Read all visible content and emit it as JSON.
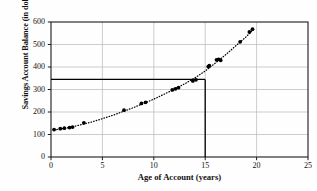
{
  "chart_data": {
    "type": "scatter",
    "title": "",
    "xlabel": "Age of Account (years)",
    "ylabel": "Savings Account Balance (in dollars)",
    "xlim": [
      0,
      25
    ],
    "ylim": [
      0,
      600
    ],
    "xticks": [
      0,
      5,
      10,
      15,
      20,
      25
    ],
    "yticks": [
      0,
      100,
      200,
      300,
      400,
      500,
      600
    ],
    "xtick_labels": [
      "0",
      "5",
      "10",
      "15",
      "20",
      "25"
    ],
    "ytick_labels": [
      "0",
      "100",
      "200",
      "300",
      "400",
      "500",
      "600"
    ],
    "grid": "both",
    "legend": "none",
    "points": [
      {
        "x": 0.3,
        "y": 122
      },
      {
        "x": 0.9,
        "y": 126
      },
      {
        "x": 1.3,
        "y": 128
      },
      {
        "x": 1.8,
        "y": 131
      },
      {
        "x": 2.1,
        "y": 133
      },
      {
        "x": 3.2,
        "y": 152
      },
      {
        "x": 7.1,
        "y": 208
      },
      {
        "x": 8.8,
        "y": 238
      },
      {
        "x": 9.2,
        "y": 243
      },
      {
        "x": 11.8,
        "y": 298
      },
      {
        "x": 12.1,
        "y": 303
      },
      {
        "x": 12.4,
        "y": 308
      },
      {
        "x": 13.8,
        "y": 338
      },
      {
        "x": 14.1,
        "y": 343
      },
      {
        "x": 15.3,
        "y": 402
      },
      {
        "x": 15.4,
        "y": 406
      },
      {
        "x": 16.1,
        "y": 432
      },
      {
        "x": 16.3,
        "y": 434
      },
      {
        "x": 16.5,
        "y": 430
      },
      {
        "x": 18.4,
        "y": 512
      },
      {
        "x": 19.3,
        "y": 556
      },
      {
        "x": 19.6,
        "y": 568
      }
    ],
    "trend_line": {
      "style": "dotted",
      "points": [
        {
          "x": 0.3,
          "y": 120
        },
        {
          "x": 2.0,
          "y": 133
        },
        {
          "x": 4.0,
          "y": 156
        },
        {
          "x": 6.0,
          "y": 185
        },
        {
          "x": 8.0,
          "y": 219
        },
        {
          "x": 10.0,
          "y": 257
        },
        {
          "x": 12.0,
          "y": 301
        },
        {
          "x": 13.0,
          "y": 325
        },
        {
          "x": 14.0,
          "y": 352
        },
        {
          "x": 15.0,
          "y": 382
        },
        {
          "x": 16.0,
          "y": 418
        },
        {
          "x": 17.0,
          "y": 455
        },
        {
          "x": 18.0,
          "y": 495
        },
        {
          "x": 19.0,
          "y": 535
        },
        {
          "x": 19.7,
          "y": 568
        }
      ]
    },
    "reference_lines": {
      "horizontal_value": 345,
      "vertical_value": 15,
      "description": "Reference lines marking account age 15 years and balance about 345 dollars"
    },
    "colors": {
      "axis": "#1a1a1a",
      "grid": "#b8b8b8",
      "point": "#000000",
      "reference": "#000000",
      "background": "#ffffff"
    }
  }
}
